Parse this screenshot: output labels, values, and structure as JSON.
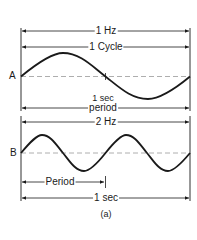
{
  "figure": {
    "caption": "(a)",
    "waveform_a": {
      "point_label": "A",
      "frequency_label": "1 Hz",
      "cycle_label": "1 Cycle",
      "time_label": "1 sec",
      "period_label": "period",
      "cycles": 1
    },
    "waveform_b": {
      "point_label": "B",
      "frequency_label": "2 Hz",
      "period_label": "Period",
      "time_label": "1 sec",
      "cycles": 2
    }
  }
}
